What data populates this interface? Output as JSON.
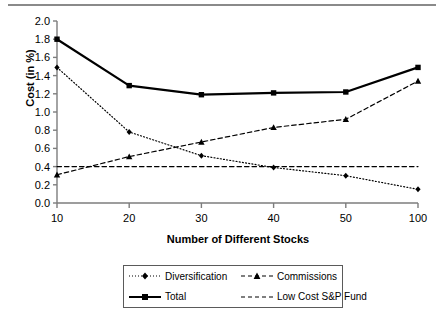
{
  "chart_data": {
    "type": "line",
    "title": "",
    "xlabel": "Number of Different Stocks",
    "ylabel": "Cost (in %)",
    "x": [
      10,
      20,
      30,
      40,
      50,
      100
    ],
    "xticklabels": [
      "10",
      "20",
      "30",
      "40",
      "50",
      "100"
    ],
    "yticks": [
      0.0,
      0.2,
      0.4,
      0.6,
      0.8,
      1.0,
      1.2,
      1.4,
      1.6,
      1.8,
      2.0
    ],
    "yticklabels": [
      "0.0",
      "0.2",
      "0.4",
      "0.6",
      "0.8",
      "1.0",
      "1.2",
      "1.4",
      "1.6",
      "1.8",
      "2.0"
    ],
    "ylim": [
      0.0,
      2.0
    ],
    "grid": false,
    "legend_position": "bottom",
    "series": [
      {
        "name": "Diversification",
        "values": [
          1.49,
          0.78,
          0.52,
          0.39,
          0.3,
          0.15
        ],
        "linestyle": "dotted",
        "marker": "diamond",
        "color": "#000000"
      },
      {
        "name": "Commissions",
        "values": [
          0.31,
          0.51,
          0.67,
          0.83,
          0.92,
          1.34
        ],
        "linestyle": "dashed",
        "marker": "triangle",
        "color": "#000000"
      },
      {
        "name": "Total",
        "values": [
          1.8,
          1.29,
          1.19,
          1.21,
          1.22,
          1.49
        ],
        "linestyle": "solid",
        "marker": "square",
        "color": "#000000"
      },
      {
        "name": "Low Cost S&P Fund",
        "values": [
          0.4,
          0.4,
          0.4,
          0.4,
          0.4,
          0.4
        ],
        "linestyle": "dashed",
        "marker": "none",
        "color": "#000000"
      }
    ]
  },
  "legend": {
    "items": [
      {
        "label": "Diversification"
      },
      {
        "label": "Commissions"
      },
      {
        "label": "Total"
      },
      {
        "label": "Low Cost S&P Fund"
      }
    ]
  },
  "axes": {
    "x_title": "Number of Different Stocks",
    "y_title": "Cost (in %)"
  }
}
